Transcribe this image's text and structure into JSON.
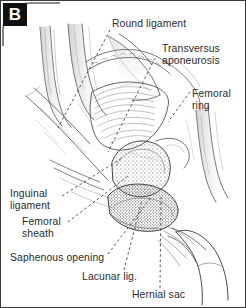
{
  "figure": {
    "panel_label": "B",
    "background_color": "#ffffff",
    "frame_color": "#3a3a3a",
    "ink_color": "#2b2b2e",
    "badge_background": "#111111",
    "badge_text_color": "#ffffff"
  },
  "labels": {
    "round_ligament": "Round ligament",
    "transversus_line1": "Transversus",
    "transversus_line2": "aponeurosis",
    "femoral_ring_line1": "Femoral",
    "femoral_ring_line2": "ring",
    "inguinal_ligament_line1": "Inguinal",
    "inguinal_ligament_line2": "ligament",
    "femoral_sheath_line1": "Femoral",
    "femoral_sheath_line2": "sheath",
    "saphenous_opening": "Saphenous opening",
    "lacunar_ligament": "Lacunar lig.",
    "hernial_sac": "Hernial sac"
  }
}
